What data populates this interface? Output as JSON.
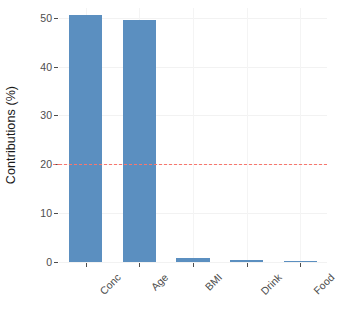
{
  "chart_data": {
    "type": "bar",
    "title": "",
    "xlabel": "",
    "ylabel": "Contributions (%)",
    "categories": [
      "Conc",
      "Age",
      "BMI",
      "Drink",
      "Food"
    ],
    "values": [
      50.5,
      49.5,
      0.8,
      0.4,
      0.15
    ],
    "ylim": [
      0,
      52
    ],
    "yticks": [
      0,
      10,
      20,
      30,
      40,
      50
    ],
    "ytick_labels": [
      "0",
      "10",
      "20",
      "30",
      "40",
      "50"
    ],
    "grid": "major-horizontal-faint",
    "legend": "none",
    "bar_color": "#5b8fc0",
    "annotations": [
      {
        "name": "threshold-line",
        "type": "hline",
        "value": 20,
        "style": "dashed",
        "color": "#f8766d"
      }
    ]
  },
  "axes": {
    "y_title": "Contributions (%)"
  }
}
